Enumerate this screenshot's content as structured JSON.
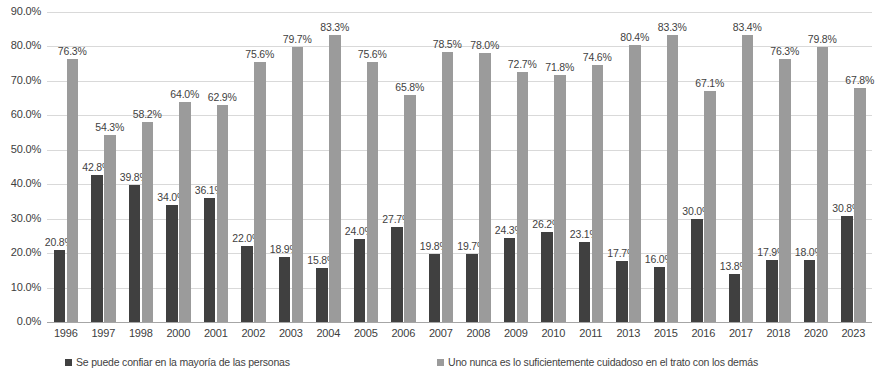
{
  "chart_data": {
    "type": "bar",
    "title": "",
    "subtitle": "",
    "xlabel": "",
    "ylabel": "",
    "ylim": [
      0,
      90
    ],
    "ytick_labels": [
      "0.0%",
      "10.0%",
      "20.0%",
      "30.0%",
      "40.0%",
      "50.0%",
      "60.0%",
      "70.0%",
      "80.0%",
      "90.0%"
    ],
    "ytick_values": [
      0,
      10,
      20,
      30,
      40,
      50,
      60,
      70,
      80,
      90
    ],
    "grid": true,
    "legend_position": "bottom",
    "categories": [
      "1996",
      "1997",
      "1998",
      "2000",
      "2001",
      "2002",
      "2003",
      "2004",
      "2005",
      "2006",
      "2007",
      "2008",
      "2009",
      "2010",
      "2011",
      "2013",
      "2015",
      "2016",
      "2017",
      "2018",
      "2020",
      "2023"
    ],
    "series": [
      {
        "name": "Se puede confiar en la mayoría de las personas",
        "color": "#404040",
        "values": [
          20.8,
          42.8,
          39.8,
          34.0,
          36.1,
          22.0,
          18.9,
          15.8,
          24.0,
          27.7,
          19.8,
          19.7,
          24.3,
          26.2,
          23.1,
          17.7,
          16.0,
          30.0,
          13.8,
          17.9,
          18.0,
          30.8
        ],
        "labels": [
          "20.8%",
          "42.8%",
          "39.8%",
          "34.0%",
          "36.1%",
          "22.0%",
          "18.9%",
          "15.8%",
          "24.0%",
          "27.7%",
          "19.8%",
          "19.7%",
          "24.3%",
          "26.2%",
          "23.1%",
          "17.7%",
          "16.0%",
          "30.0%",
          "13.8%",
          "17.9%",
          "18.0%",
          "30.8%"
        ]
      },
      {
        "name": "Uno nunca es lo suficientemente cuidadoso en el trato con los demás",
        "color": "#9b9b9b",
        "values": [
          76.3,
          54.3,
          58.2,
          64.0,
          62.9,
          75.6,
          79.7,
          83.3,
          75.6,
          65.8,
          78.5,
          78.0,
          72.7,
          71.8,
          74.6,
          80.4,
          83.3,
          67.1,
          83.4,
          76.3,
          79.8,
          67.8
        ],
        "labels": [
          "76.3%",
          "54.3%",
          "58.2%",
          "64.0%",
          "62.9%",
          "75.6%",
          "79.7%",
          "83.3%",
          "75.6%",
          "65.8%",
          "78.5%",
          "78.0%",
          "72.7%",
          "71.8%",
          "74.6%",
          "80.4%",
          "83.3%",
          "67.1%",
          "83.4%",
          "76.3%",
          "79.8%",
          "67.8%"
        ]
      }
    ]
  },
  "legend": {
    "items": [
      {
        "label": "Se puede confiar en la mayoría de las personas",
        "color": "#404040"
      },
      {
        "label": "Uno nunca es lo suficientemente cuidadoso en el trato con los demás",
        "color": "#9b9b9b"
      }
    ]
  }
}
